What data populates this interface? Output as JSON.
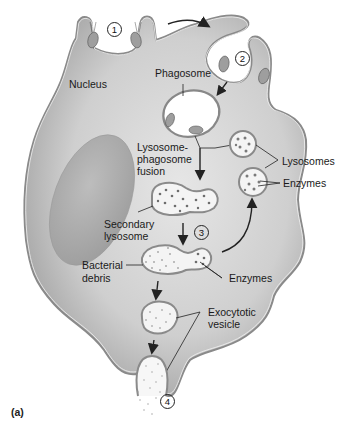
{
  "figure": {
    "panel_label": "(a)"
  },
  "steps": [
    {
      "number": "1",
      "meaning": "attachment / pseudopod extension"
    },
    {
      "number": "2",
      "meaning": "engulfment"
    },
    {
      "number": "3",
      "meaning": "digestion"
    },
    {
      "number": "4",
      "meaning": "exocytosis"
    }
  ],
  "labels": {
    "nucleus": "Nucleus",
    "phagosome": "Phagosome",
    "fusion_line1": "Lysosome-",
    "fusion_line2": "phagosome",
    "fusion_line3": "fusion",
    "lysosomes": "Lysosomes",
    "enzymes_top": "Enzymes",
    "secondary_line1": "Secondary",
    "secondary_line2": "lysosome",
    "debris_line1": "Bacterial",
    "debris_line2": "debris",
    "enzymes_bottom": "Enzymes",
    "exo_line1": "Exocytotic",
    "exo_line2": "vesicle"
  },
  "colors": {
    "cell_fill": "#b9b9b9",
    "cell_edge": "#7a7a7a",
    "nucleus": "#a5a5a5",
    "vesicle_fill": "#f7f7f7",
    "dots": "#6a6a6a",
    "text": "#1a1a1a"
  }
}
